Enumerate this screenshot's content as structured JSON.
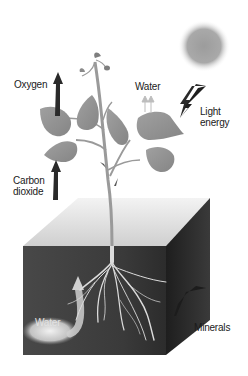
{
  "diagram": {
    "labels": {
      "oxygen": "Oxygen",
      "water_top": "Water",
      "light_line1": "Light",
      "light_line2": "energy",
      "carbon_line1": "Carbon",
      "carbon_line2": "dioxide",
      "water_bottom": "Water",
      "minerals": "Minerals"
    },
    "colors": {
      "leaf": "#8f8f8f",
      "stem": "#9a9a9a",
      "arrow": "#2a2a2a",
      "sun": "#a8a8a8",
      "soil_front": "#3c3c3c",
      "soil_side": "#2a2a2a",
      "soil_top": "#e6e6e6",
      "roots": "#d8d8d8",
      "water_glow": "#e8e8e8"
    }
  }
}
